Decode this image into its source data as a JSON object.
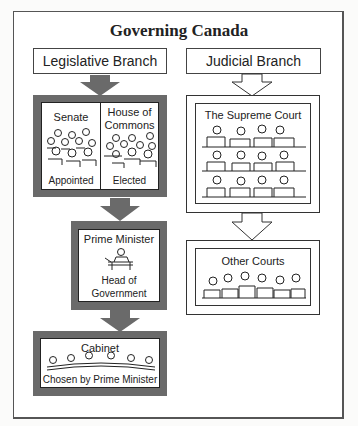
{
  "title": "Governing Canada",
  "legislative": {
    "header": "Legislative Branch",
    "senate": {
      "name": "Senate",
      "note": "Appointed"
    },
    "house": {
      "name_line1": "House of",
      "name_line2": "Commons",
      "note": "Elected"
    },
    "prime_minister": {
      "name": "Prime Minister",
      "note_line1": "Head of",
      "note_line2": "Government"
    },
    "cabinet": {
      "name": "Cabinet",
      "note": "Chosen by Prime Minister"
    }
  },
  "judicial": {
    "header": "Judicial Branch",
    "supreme_court": {
      "name": "The Supreme Court"
    },
    "other_courts": {
      "name": "Other Courts"
    }
  },
  "colors": {
    "dark_frame": "#6a6a6a",
    "arrow_fill": "#6a6a6a",
    "line": "#333333"
  }
}
